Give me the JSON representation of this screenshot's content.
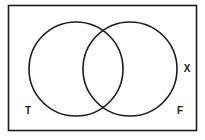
{
  "diagram": {
    "type": "venn-two-circles",
    "region_labels": {
      "bottom_left": "T",
      "bottom_right": "F",
      "outside_right": "X"
    },
    "colors": {
      "stroke": "#1b1b1b",
      "background": "#ffffff"
    }
  }
}
